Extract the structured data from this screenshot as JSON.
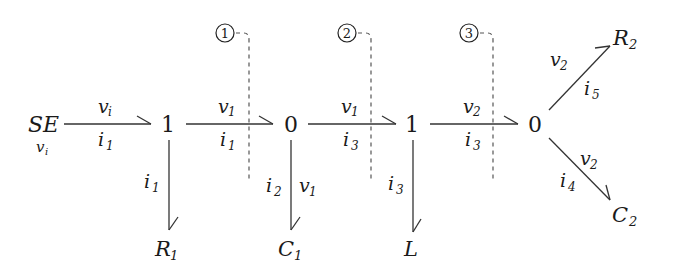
{
  "diagram": {
    "type": "bond-graph",
    "nodes": {
      "source": {
        "label": "SE",
        "sub": "v",
        "subsub": "i"
      },
      "j1a": {
        "label": "1"
      },
      "j0a": {
        "label": "0"
      },
      "j1b": {
        "label": "1"
      },
      "j0b": {
        "label": "0"
      },
      "r1": {
        "label": "R",
        "sub": "1"
      },
      "c1": {
        "label": "C",
        "sub": "1"
      },
      "l": {
        "label": "L"
      },
      "r2": {
        "label": "R",
        "sub": "2"
      },
      "c2": {
        "label": "C",
        "sub": "2"
      }
    },
    "bonds": {
      "b1": {
        "effort": "v",
        "effort_sub": "i",
        "flow": "i",
        "flow_sub": "1"
      },
      "b2": {
        "effort": "v",
        "effort_sub": "1",
        "flow": "i",
        "flow_sub": "1"
      },
      "b3": {
        "effort": "v",
        "effort_sub": "1",
        "flow": "i",
        "flow_sub": "3"
      },
      "b4": {
        "effort": "v",
        "effort_sub": "2",
        "flow": "i",
        "flow_sub": "3"
      },
      "r1": {
        "flow": "i",
        "flow_sub": "1"
      },
      "c1": {
        "flow": "i",
        "flow_sub": "2",
        "effort": "v",
        "effort_sub": "1"
      },
      "l": {
        "flow": "i",
        "flow_sub": "3"
      },
      "r2": {
        "effort": "v",
        "effort_sub": "2",
        "flow": "i",
        "flow_sub": "5"
      },
      "c2": {
        "effort": "v",
        "effort_sub": "2",
        "flow": "i",
        "flow_sub": "4"
      }
    },
    "markers": [
      {
        "label": "1"
      },
      {
        "label": "2"
      },
      {
        "label": "3"
      }
    ]
  }
}
